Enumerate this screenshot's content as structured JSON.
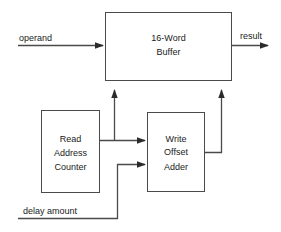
{
  "diagram": {
    "type": "block-diagram",
    "background_color": "#ffffff",
    "line_color": "#404040",
    "text_color": "#1a1a1a",
    "blocks": [
      {
        "id": "buffer",
        "label_lines": [
          "16-Word",
          "Buffer"
        ],
        "line1": "16-Word",
        "line2": "Buffer",
        "x": 105,
        "y": 12,
        "width": 127,
        "height": 69
      },
      {
        "id": "read-address-counter",
        "label_lines": [
          "Read",
          "Address",
          "Counter"
        ],
        "line1": "Read",
        "line2": "Address",
        "line3": "Counter",
        "x": 41,
        "y": 110,
        "width": 59,
        "height": 83
      },
      {
        "id": "write-offset-adder",
        "label_lines": [
          "Write",
          "Offset",
          "Adder"
        ],
        "line1": "Write",
        "line2": "Offset",
        "line3": "Adder",
        "x": 147,
        "y": 112,
        "width": 58,
        "height": 80
      }
    ],
    "signals": [
      {
        "id": "operand",
        "label": "operand",
        "x": 18,
        "y": 33,
        "target": "buffer"
      },
      {
        "id": "result",
        "label": "result",
        "x": 240,
        "y": 32,
        "source": "buffer"
      },
      {
        "id": "delay-amount",
        "label": "delay amount",
        "x": 22,
        "y": 205,
        "target": "write-offset-adder"
      }
    ]
  }
}
